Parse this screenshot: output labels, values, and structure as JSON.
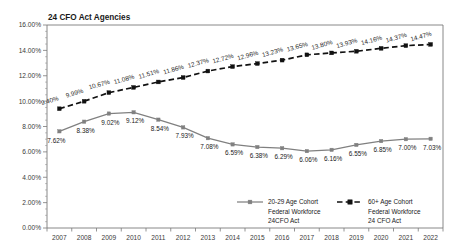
{
  "chart_data": {
    "type": "line",
    "title": "24 CFO Act Agencies",
    "xlabel": "",
    "ylabel": "",
    "ylim": [
      0,
      16
    ],
    "ytick_labels": [
      "0.00%",
      "2.00%",
      "4.00%",
      "6.00%",
      "8.00%",
      "10.00%",
      "12.00%",
      "14.00%",
      "16.00%"
    ],
    "ytick_values": [
      0,
      2,
      4,
      6,
      8,
      10,
      12,
      14,
      16
    ],
    "grid": false,
    "legend_position": "inside-bottom-center",
    "categories": [
      "2007",
      "2008",
      "2009",
      "2010",
      "2011",
      "2012",
      "2013",
      "2014",
      "2015",
      "2016",
      "2017",
      "2018",
      "2019",
      "2020",
      "2021",
      "2022"
    ],
    "series": [
      {
        "name": "20-29 Age Cohort Federal Workforce 24CFO Act",
        "legend_lines": [
          "20-29 Age Cohort",
          "Federal Workforce",
          "24CFO Act"
        ],
        "color": "#808080",
        "style": "solid",
        "values": [
          7.62,
          8.38,
          9.02,
          9.12,
          8.54,
          7.93,
          7.08,
          6.59,
          6.38,
          6.29,
          6.06,
          6.16,
          6.55,
          6.85,
          7.0,
          7.03
        ],
        "labels": [
          "7.62%",
          "8.38%",
          "9.02%",
          "9.12%",
          "8.54%",
          "7.93%",
          "7.08%",
          "6.59%",
          "6.38%",
          "6.29%",
          "6.06%",
          "6.16%",
          "6.55%",
          "6.85%",
          "7.00%",
          "7.03%"
        ]
      },
      {
        "name": "60+ Age Cohort Federal Workforce 24 CFO Act",
        "legend_lines": [
          "60+ Age Cohort",
          "Federal Workforce",
          "24 CFO Act"
        ],
        "color": "#111111",
        "style": "dashed",
        "values": [
          9.4,
          9.99,
          10.67,
          11.08,
          11.51,
          11.86,
          12.37,
          12.72,
          12.96,
          13.23,
          13.65,
          13.8,
          13.93,
          14.16,
          14.37,
          14.47
        ],
        "labels": [
          "9.40%",
          "9.99%",
          "10.67%",
          "11.08%",
          "11.51%",
          "11.86%",
          "12.37%",
          "12.72%",
          "12.96%",
          "13.23%",
          "13.65%",
          "13.80%",
          "13.93%",
          "14.16%",
          "14.37%",
          "14.47%"
        ]
      }
    ]
  }
}
